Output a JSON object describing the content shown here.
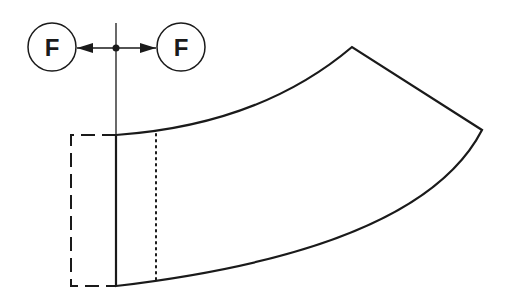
{
  "diagram": {
    "colors": {
      "stroke": "#1a1a1a",
      "background": "#ffffff"
    },
    "forces": [
      {
        "label": "F",
        "direction": "left",
        "cx": 52,
        "cy": 47
      },
      {
        "label": "F",
        "direction": "right",
        "cx": 181,
        "cy": 47
      }
    ],
    "line_styles": {
      "outline": "solid",
      "original_position": "dashed",
      "reference_line": "dotted"
    }
  }
}
